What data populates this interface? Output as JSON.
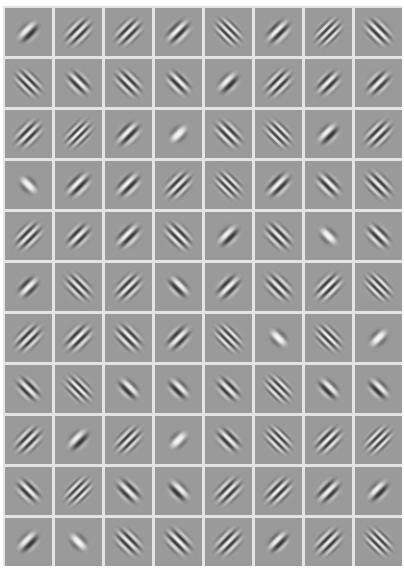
{
  "figure": {
    "rows": 11,
    "cols": 8,
    "colors": {
      "background": "#ffffff",
      "gap": "#e4e4e4",
      "cell_gray": "#9a9a9a",
      "dark": "#111111",
      "light": "#f4f4f4"
    },
    "filters": [
      [
        {
          "o": -45,
          "w": 12,
          "s": 7,
          "p": 0.5
        },
        {
          "o": -45,
          "w": 7,
          "s": 9,
          "p": 0
        },
        {
          "o": -45,
          "w": 7,
          "s": 9,
          "p": 0
        },
        {
          "o": -45,
          "w": 9,
          "s": 8,
          "p": 0.5
        },
        {
          "o": 45,
          "w": 6,
          "s": 9,
          "p": 0
        },
        {
          "o": -45,
          "w": 9,
          "s": 8,
          "p": 0.5
        },
        {
          "o": -45,
          "w": 6,
          "s": 9,
          "p": 0
        },
        {
          "o": 45,
          "w": 7,
          "s": 9,
          "p": 0.25
        }
      ],
      [
        {
          "o": 45,
          "w": 6.5,
          "s": 9,
          "p": 0
        },
        {
          "o": 45,
          "w": 8,
          "s": 8,
          "p": 0.25
        },
        {
          "o": 45,
          "w": 7,
          "s": 9,
          "p": 0
        },
        {
          "o": 45,
          "w": 8,
          "s": 8,
          "p": 0.5
        },
        {
          "o": -45,
          "w": 11,
          "s": 7,
          "p": 0.5
        },
        {
          "o": -45,
          "w": 7,
          "s": 9,
          "p": 0
        },
        {
          "o": -45,
          "w": 8,
          "s": 8,
          "p": 0.25
        },
        {
          "o": -45,
          "w": 8,
          "s": 8,
          "p": 0
        }
      ],
      [
        {
          "o": -45,
          "w": 7,
          "s": 9,
          "p": 0
        },
        {
          "o": -45,
          "w": 6,
          "s": 9,
          "p": 0.25
        },
        {
          "o": -45,
          "w": 9,
          "s": 8,
          "p": 0.5
        },
        {
          "o": -45,
          "w": 16,
          "s": 6,
          "p": 0
        },
        {
          "o": 45,
          "w": 7,
          "s": 9,
          "p": 0.25
        },
        {
          "o": 45,
          "w": 6,
          "s": 9,
          "p": 0
        },
        {
          "o": -45,
          "w": 11,
          "s": 7,
          "p": 0.5
        },
        {
          "o": -45,
          "w": 7,
          "s": 9,
          "p": 0
        }
      ],
      [
        {
          "o": 45,
          "w": 15,
          "s": 6,
          "p": 0
        },
        {
          "o": -45,
          "w": 9,
          "s": 8,
          "p": 0.5
        },
        {
          "o": -45,
          "w": 9,
          "s": 8,
          "p": 0.5
        },
        {
          "o": -45,
          "w": 7,
          "s": 9,
          "p": 0
        },
        {
          "o": 45,
          "w": 6,
          "s": 9,
          "p": 0
        },
        {
          "o": -45,
          "w": 9,
          "s": 8,
          "p": 0.25
        },
        {
          "o": 45,
          "w": 8,
          "s": 8,
          "p": 0.5
        },
        {
          "o": 45,
          "w": 7,
          "s": 9,
          "p": 0
        }
      ],
      [
        {
          "o": -45,
          "w": 7,
          "s": 9,
          "p": 0
        },
        {
          "o": -45,
          "w": 8,
          "s": 8,
          "p": 0
        },
        {
          "o": -45,
          "w": 9,
          "s": 8,
          "p": 0.5
        },
        {
          "o": 45,
          "w": 7,
          "s": 9,
          "p": 0.25
        },
        {
          "o": -45,
          "w": 11,
          "s": 7,
          "p": 0.5
        },
        {
          "o": 45,
          "w": 7,
          "s": 9,
          "p": 0
        },
        {
          "o": 45,
          "w": 15,
          "s": 6,
          "p": 0
        },
        {
          "o": 45,
          "w": 8,
          "s": 8,
          "p": 0.5
        }
      ],
      [
        {
          "o": -45,
          "w": 10,
          "s": 7,
          "p": 0
        },
        {
          "o": 45,
          "w": 6.5,
          "s": 9,
          "p": 0
        },
        {
          "o": -45,
          "w": 7,
          "s": 9,
          "p": 0
        },
        {
          "o": 45,
          "w": 10,
          "s": 7,
          "p": 0.5
        },
        {
          "o": -45,
          "w": 9,
          "s": 8,
          "p": 0
        },
        {
          "o": 45,
          "w": 7,
          "s": 9,
          "p": 0
        },
        {
          "o": -45,
          "w": 7,
          "s": 9,
          "p": 0.25
        },
        {
          "o": 45,
          "w": 6,
          "s": 9,
          "p": 0
        }
      ],
      [
        {
          "o": -45,
          "w": 7,
          "s": 9,
          "p": 0
        },
        {
          "o": -45,
          "w": 7.5,
          "s": 9,
          "p": 0.25
        },
        {
          "o": 45,
          "w": 7,
          "s": 9,
          "p": 0.5
        },
        {
          "o": -45,
          "w": 9,
          "s": 8,
          "p": 0
        },
        {
          "o": 45,
          "w": 6,
          "s": 9,
          "p": 0
        },
        {
          "o": 45,
          "w": 15,
          "s": 6,
          "p": 0
        },
        {
          "o": 45,
          "w": 6,
          "s": 9,
          "p": 0.25
        },
        {
          "o": -45,
          "w": 15,
          "s": 6,
          "p": 0
        }
      ],
      [
        {
          "o": 45,
          "w": 8,
          "s": 8,
          "p": 0
        },
        {
          "o": 45,
          "w": 6,
          "s": 9,
          "p": 0.25
        },
        {
          "o": 45,
          "w": 10,
          "s": 7,
          "p": 0.5
        },
        {
          "o": 45,
          "w": 10,
          "s": 7,
          "p": 0.5
        },
        {
          "o": 45,
          "w": 8,
          "s": 8,
          "p": 0
        },
        {
          "o": 45,
          "w": 6,
          "s": 9,
          "p": 0
        },
        {
          "o": 45,
          "w": 10,
          "s": 7,
          "p": 0.5
        },
        {
          "o": 45,
          "w": 10,
          "s": 7,
          "p": 0.5
        }
      ],
      [
        {
          "o": -45,
          "w": 7,
          "s": 9,
          "p": 0
        },
        {
          "o": -45,
          "w": 12,
          "s": 7,
          "p": 0.5
        },
        {
          "o": -45,
          "w": 6.5,
          "s": 9,
          "p": 0
        },
        {
          "o": -45,
          "w": 16,
          "s": 6,
          "p": 0
        },
        {
          "o": 45,
          "w": 8,
          "s": 8,
          "p": 0.25
        },
        {
          "o": 45,
          "w": 6,
          "s": 9,
          "p": 0
        },
        {
          "o": -45,
          "w": 7,
          "s": 9,
          "p": 0.25
        },
        {
          "o": -45,
          "w": 6,
          "s": 9,
          "p": 0
        }
      ],
      [
        {
          "o": 45,
          "w": 8,
          "s": 8,
          "p": 0.25
        },
        {
          "o": -45,
          "w": 6,
          "s": 9,
          "p": 0
        },
        {
          "o": 45,
          "w": 9,
          "s": 8,
          "p": 0
        },
        {
          "o": 45,
          "w": 11,
          "s": 7,
          "p": 0.5
        },
        {
          "o": -45,
          "w": 7,
          "s": 9,
          "p": 0
        },
        {
          "o": -45,
          "w": 7,
          "s": 9,
          "p": 0.25
        },
        {
          "o": -45,
          "w": 9,
          "s": 8,
          "p": 0
        },
        {
          "o": -45,
          "w": 11,
          "s": 7,
          "p": 0.5
        }
      ],
      [
        {
          "o": -45,
          "w": 12,
          "s": 7,
          "p": 0.5
        },
        {
          "o": 45,
          "w": 15,
          "s": 6,
          "p": 0
        },
        {
          "o": 45,
          "w": 7,
          "s": 9,
          "p": 0
        },
        {
          "o": 45,
          "w": 7.5,
          "s": 9,
          "p": 0.25
        },
        {
          "o": -45,
          "w": 7,
          "s": 9,
          "p": 0
        },
        {
          "o": -45,
          "w": 10,
          "s": 7,
          "p": 0.5
        },
        {
          "o": -45,
          "w": 7,
          "s": 9,
          "p": 0
        },
        {
          "o": 45,
          "w": 6,
          "s": 9,
          "p": 0
        }
      ]
    ]
  }
}
